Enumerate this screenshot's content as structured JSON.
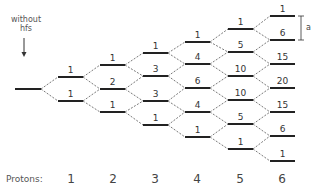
{
  "annotation": {
    "line1": "without",
    "line2": "hfs"
  },
  "splitting_label": "a",
  "protons_label": "Protons:",
  "proton_counts": [
    "1",
    "2",
    "3",
    "4",
    "5",
    "6"
  ],
  "levels": [
    {
      "x": 15,
      "w": 26,
      "ys": [
        89
      ],
      "labels": [
        ""
      ]
    },
    {
      "x": 58,
      "w": 25,
      "ys": [
        77,
        101
      ],
      "labels": [
        "1",
        "1"
      ]
    },
    {
      "x": 100,
      "w": 25,
      "ys": [
        65,
        89,
        112
      ],
      "labels": [
        "1",
        "2",
        "1"
      ]
    },
    {
      "x": 143,
      "w": 25,
      "ys": [
        53,
        76,
        101,
        125
      ],
      "labels": [
        "1",
        "3",
        "3",
        "1"
      ]
    },
    {
      "x": 185,
      "w": 25,
      "ys": [
        42,
        64,
        88,
        112,
        137
      ],
      "labels": [
        "1",
        "4",
        "6",
        "4",
        "1"
      ]
    },
    {
      "x": 228,
      "w": 25,
      "ys": [
        29,
        52,
        76,
        100,
        124,
        149
      ],
      "labels": [
        "1",
        "5",
        "10",
        "10",
        "5",
        "1"
      ]
    },
    {
      "x": 270,
      "w": 25,
      "ys": [
        16,
        40,
        64,
        88,
        112,
        136,
        161
      ],
      "labels": [
        "1",
        "6",
        "15",
        "20",
        "15",
        "6",
        "1"
      ]
    }
  ],
  "proton_x": [
    71,
    113,
    155,
    197,
    240,
    282
  ]
}
